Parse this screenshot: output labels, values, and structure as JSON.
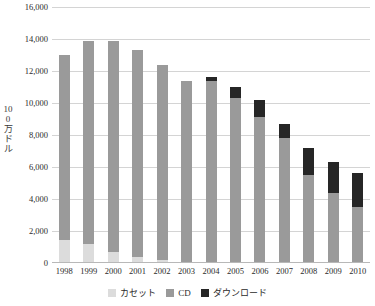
{
  "chart_data": {
    "type": "bar",
    "stacked": true,
    "title": "",
    "xlabel": "",
    "ylabel": "100万ドル",
    "ylim": [
      0,
      16000
    ],
    "ytick_step": 2000,
    "ytick_labels": [
      "16,000",
      "14,000",
      "12,000",
      "10,000",
      "8,000",
      "6,000",
      "4,000",
      "2,000",
      "0"
    ],
    "ytick_values": [
      16000,
      14000,
      12000,
      10000,
      8000,
      6000,
      4000,
      2000,
      0
    ],
    "grid": true,
    "legend_position": "bottom",
    "categories": [
      "1998",
      "1999",
      "2000",
      "2001",
      "2002",
      "2003",
      "2004",
      "2005",
      "2006",
      "2007",
      "2008",
      "2009",
      "2010"
    ],
    "series": [
      {
        "name": "カセット",
        "color": "#dcdcdc",
        "values": [
          1450,
          1200,
          700,
          350,
          200,
          0,
          0,
          0,
          0,
          0,
          0,
          0,
          0
        ]
      },
      {
        "name": "CD",
        "color": "#9a9a9a",
        "values": [
          11550,
          12700,
          13200,
          12950,
          12150,
          11350,
          11350,
          10300,
          9100,
          7800,
          5500,
          4400,
          3500
        ]
      },
      {
        "name": "ダウンロード",
        "color": "#262626",
        "values": [
          0,
          0,
          0,
          0,
          0,
          0,
          250,
          700,
          1100,
          900,
          1700,
          1900,
          2100
        ]
      }
    ],
    "totals": [
      13000,
      13900,
      13900,
      13300,
      12350,
      11350,
      11600,
      11000,
      10200,
      8700,
      7200,
      6300,
      5600
    ]
  },
  "legend": {
    "items": [
      {
        "label": "カセット",
        "swatch": "#dcdcdc"
      },
      {
        "label": "CD",
        "swatch": "#9a9a9a"
      },
      {
        "label": "ダウンロード",
        "swatch": "#262626"
      }
    ]
  }
}
